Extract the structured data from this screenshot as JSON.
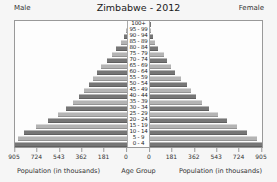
{
  "colors": {
    "bar_dark": "#767676",
    "bar_light": "#b4b4b4",
    "plot_border": "#999999",
    "background": "#f6f6f6",
    "plot_background": "#fdfdfd",
    "text": "#333333"
  },
  "chart_data": {
    "type": "bar",
    "subtype": "population-pyramid",
    "title": "Zimbabwe - 2012",
    "left_series_header": "Male",
    "right_series_header": "Female",
    "xlabel": "Population (in thousands)",
    "center_axis_label": "Age Group",
    "x_axis_unit": "thousands",
    "xlim_each_side": [
      0,
      905
    ],
    "x_ticks_left": [
      "905",
      "724",
      "543",
      "362",
      "181",
      "0"
    ],
    "x_ticks_right": [
      "0",
      "181",
      "362",
      "543",
      "724",
      "905"
    ],
    "categories_order": "top-to-bottom",
    "categories": [
      "100+",
      "95 - 99",
      "90 - 94",
      "85 - 89",
      "80 - 84",
      "75 - 79",
      "70 - 74",
      "65 - 69",
      "60 - 64",
      "55 - 59",
      "50 - 54",
      "45 - 49",
      "40 - 44",
      "35 - 39",
      "30 - 34",
      "25 - 29",
      "20 - 24",
      "15 - 19",
      "10 - 14",
      "5 - 9",
      "0 - 4"
    ],
    "series": [
      {
        "name": "Male",
        "side": "left",
        "values": [
          2,
          8,
          25,
          49,
          90,
          123,
          165,
          214,
          239,
          272,
          304,
          346,
          387,
          436,
          494,
          560,
          642,
          732,
          831,
          881,
          905
        ]
      },
      {
        "name": "Female",
        "side": "right",
        "values": [
          3,
          10,
          25,
          41,
          66,
          115,
          140,
          173,
          206,
          247,
          296,
          329,
          370,
          420,
          477,
          551,
          625,
          699,
          782,
          864,
          905
        ]
      }
    ],
    "legend_position": "none",
    "grid": false
  }
}
